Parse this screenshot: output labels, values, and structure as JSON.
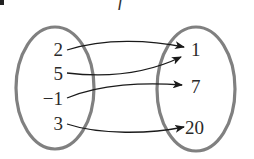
{
  "diagram": {
    "title": "f",
    "bullet": "•",
    "domain_set": {
      "elements": [
        "2",
        "5",
        "−1",
        "3"
      ]
    },
    "range_set": {
      "elements": [
        "1",
        "7",
        "20"
      ]
    },
    "mappings": [
      {
        "from": "2",
        "to": "1"
      },
      {
        "from": "5",
        "to": "1"
      },
      {
        "from": "−1",
        "to": "7"
      },
      {
        "from": "3",
        "to": "20"
      }
    ],
    "colors": {
      "set_outline": "#808080",
      "arrow": "#1a1a1a",
      "text": "#2a2a2a"
    }
  }
}
